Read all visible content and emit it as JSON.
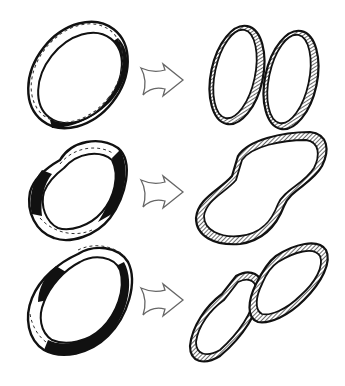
{
  "figure": {
    "description": "Hand-drawn illustration of band/strip cutting outcomes",
    "rows": [
      {
        "id": "row-1",
        "before": "plain loop, dashed center line",
        "after": "two separate loops"
      },
      {
        "id": "row-2",
        "before": "loop with one half-twist (Mobius strip), dashed center line",
        "after": "one long loop with two twists"
      },
      {
        "id": "row-3",
        "before": "loop with one-and-a-half twists, dashed center line",
        "after": "two interlinked loops"
      }
    ],
    "colors": {
      "ink": "#111111",
      "paper": "#ffffff",
      "hatch": "#555555",
      "arrow": "#666666"
    }
  }
}
